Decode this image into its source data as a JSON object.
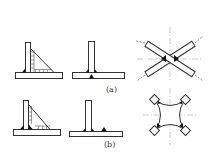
{
  "figure": {
    "labels": {
      "a": "(a)",
      "b": "(b)"
    },
    "parts": [
      {
        "row": "a",
        "name": "stiffened-tee-joint",
        "description": "T-joint with triangular gusset stiffener, hatched weld"
      },
      {
        "row": "a",
        "name": "tee-joint",
        "description": "Simple T-joint with fillet welds"
      },
      {
        "row": "a",
        "name": "crossed-bars-joint",
        "description": "Two crossed bars welded at intersection with centerlines and force arrows"
      },
      {
        "row": "b",
        "name": "stiffened-tee-joint-alt",
        "description": "T-joint with gusset, welds at root and gusset toe"
      },
      {
        "row": "b",
        "name": "tee-joint-offset-weld",
        "description": "T-joint with additional weld on base plate offset"
      },
      {
        "row": "b",
        "name": "cruciform-plate",
        "description": "Concave cruciform plate with welded square bosses at corners"
      }
    ],
    "colors": {
      "line": "#333333",
      "fill": "#111111",
      "centerline": "#888888"
    }
  }
}
